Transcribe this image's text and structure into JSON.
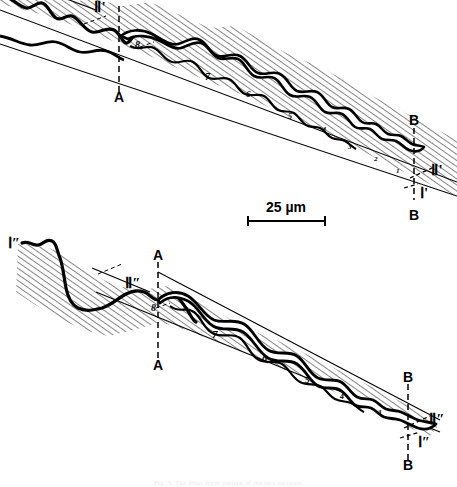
{
  "figure": {
    "kind": "scientific-line-drawing",
    "background_color": "#ffffff",
    "ink_color": "#000000",
    "hatch_color": "#2b2b2b",
    "scale_bar": {
      "label": "25 µm",
      "x_start": 248,
      "x_end": 325,
      "y": 221
    },
    "caption": "Fig. 3. The filter layer pattern of the two sections."
  },
  "panels": [
    {
      "id": "top",
      "name": "upper-section-drawing",
      "labels": [
        {
          "name": "label-II-prime-left",
          "text": "Ⅱ'",
          "x": 100,
          "y": 12
        },
        {
          "name": "label-A-top",
          "text": "A",
          "x": 119,
          "y": 100
        },
        {
          "name": "label-B-top",
          "text": "B",
          "x": 414,
          "y": 123
        },
        {
          "name": "label-II-prime-right",
          "text": "Ⅱ'",
          "x": 437,
          "y": 170
        },
        {
          "name": "label-I-prime-right",
          "text": "Ⅰ'",
          "x": 424,
          "y": 194
        },
        {
          "name": "label-B-bottom",
          "text": "B",
          "x": 414,
          "y": 216
        }
      ],
      "lamella_numbers": [
        {
          "text": "8",
          "x": 135,
          "y": 48
        },
        {
          "text": "7",
          "x": 205,
          "y": 78
        },
        {
          "text": "6",
          "x": 246,
          "y": 95
        },
        {
          "text": "5",
          "x": 288,
          "y": 118
        },
        {
          "text": "4",
          "x": 322,
          "y": 132
        },
        {
          "text": "3",
          "x": 348,
          "y": 148
        },
        {
          "text": "2",
          "x": 374,
          "y": 160
        },
        {
          "text": "1",
          "x": 396,
          "y": 172
        }
      ]
    },
    {
      "id": "bottom",
      "name": "lower-section-drawing",
      "labels": [
        {
          "name": "label-I-dprime-left",
          "text": "Ⅰ″",
          "x": 11,
          "y": 245
        },
        {
          "name": "label-A-top",
          "text": "A",
          "x": 158,
          "y": 258
        },
        {
          "name": "label-II-dprime-left",
          "text": "Ⅱ″",
          "x": 133,
          "y": 283
        },
        {
          "name": "label-A-bottom",
          "text": "A",
          "x": 158,
          "y": 364
        },
        {
          "name": "label-B-top",
          "text": "B",
          "x": 408,
          "y": 380
        },
        {
          "name": "label-II-dprime-right",
          "text": "Ⅱ″",
          "x": 436,
          "y": 419
        },
        {
          "name": "label-I-dprime-right",
          "text": "Ⅰ″",
          "x": 424,
          "y": 443
        },
        {
          "name": "label-B-bottom",
          "text": "B",
          "x": 408,
          "y": 466
        }
      ],
      "lamella_numbers": [
        {
          "text": "8",
          "x": 151,
          "y": 309
        },
        {
          "text": "7",
          "x": 212,
          "y": 336
        },
        {
          "text": "6",
          "x": 262,
          "y": 360
        },
        {
          "text": "5",
          "x": 305,
          "y": 381
        },
        {
          "text": "4",
          "x": 340,
          "y": 397
        },
        {
          "text": "3",
          "x": 378,
          "y": 412
        }
      ]
    }
  ]
}
